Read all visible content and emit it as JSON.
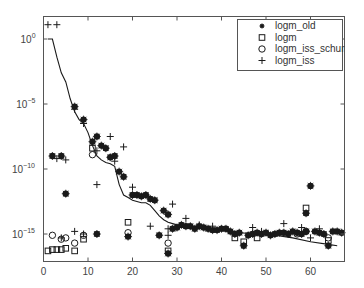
{
  "chart_data": {
    "type": "scatter",
    "title": "",
    "xlabel": "",
    "ylabel": "",
    "xscale": "linear",
    "yscale": "log",
    "xlim": [
      0,
      67
    ],
    "ylim_log10": [
      -17.5,
      1.7
    ],
    "grid": false,
    "legend_position": "upper right",
    "x_ticks": [
      0,
      10,
      20,
      30,
      40,
      50,
      60
    ],
    "x_tick_labels": [
      "0",
      "10",
      "20",
      "30",
      "40",
      "50",
      "60"
    ],
    "y_ticks_log10": [
      0,
      -5,
      -10,
      -15
    ],
    "y_tick_labels": [
      {
        "base": "10",
        "exp": "0"
      },
      {
        "base": "10",
        "exp": "−5"
      },
      {
        "base": "10",
        "exp": "−10"
      },
      {
        "base": "10",
        "exp": "−15"
      }
    ],
    "line": {
      "name": "condition-based bound (solid line)",
      "x": [
        1,
        2,
        3,
        4,
        5,
        6,
        7,
        8,
        9,
        10,
        11,
        12,
        13,
        14,
        15,
        16,
        17,
        18,
        19,
        20,
        21,
        22,
        23,
        24,
        25,
        26,
        27,
        28,
        29,
        30,
        32,
        35,
        38,
        40,
        44,
        48,
        52,
        56,
        60,
        64,
        66
      ],
      "log10": [
        0,
        0,
        -1.4,
        -2.6,
        -3.3,
        -4.6,
        -5.6,
        -6.2,
        -6.5,
        -7.2,
        -8.2,
        -9.0,
        -9.3,
        -9.5,
        -9.6,
        -9.8,
        -11.2,
        -12.0,
        -12.2,
        -12.4,
        -12.5,
        -12.6,
        -12.6,
        -12.8,
        -13.2,
        -13.6,
        -13.9,
        -14.1,
        -14.2,
        -14.3,
        -14.4,
        -14.5,
        -14.6,
        -14.7,
        -14.9,
        -15.0,
        -15.1,
        -15.3,
        -15.6,
        -15.8,
        -15.9
      ]
    },
    "series": [
      {
        "name": "logm_old",
        "marker": "asterisk-filled",
        "points": [
          [
            2,
            -9.0
          ],
          [
            4,
            -9.0
          ],
          [
            5,
            -11.9
          ],
          [
            7,
            -5.2
          ],
          [
            9,
            -6.2
          ],
          [
            11,
            -7.9
          ],
          [
            12,
            -7.5
          ],
          [
            12,
            -15.0
          ],
          [
            13,
            -8.2
          ],
          [
            14,
            -8.4
          ],
          [
            15,
            -9.1
          ],
          [
            16,
            -9.0
          ],
          [
            17,
            -10.2
          ],
          [
            18,
            -10.6
          ],
          [
            19,
            -15.2
          ],
          [
            20,
            -12.0
          ],
          [
            21,
            -12.0
          ],
          [
            22,
            -12.1
          ],
          [
            23,
            -12.0
          ],
          [
            24,
            -12.3
          ],
          [
            25,
            -12.4
          ],
          [
            26,
            -15.1
          ],
          [
            27,
            -13.2
          ],
          [
            28,
            -13.5
          ],
          [
            28,
            -16.5
          ],
          [
            29,
            -14.6
          ],
          [
            30,
            -14.5
          ],
          [
            31,
            -14.3
          ],
          [
            32,
            -14.4
          ],
          [
            33,
            -14.4
          ],
          [
            34,
            -14.6
          ],
          [
            35,
            -14.4
          ],
          [
            36,
            -14.5
          ],
          [
            37,
            -14.6
          ],
          [
            38,
            -14.7
          ],
          [
            39,
            -14.7
          ],
          [
            40,
            -14.6
          ],
          [
            41,
            -14.6
          ],
          [
            42,
            -14.8
          ],
          [
            43,
            -15.0
          ],
          [
            44,
            -14.9
          ],
          [
            45,
            -15.9
          ],
          [
            46,
            -15.1
          ],
          [
            47,
            -15.0
          ],
          [
            48,
            -14.9
          ],
          [
            49,
            -15.0
          ],
          [
            50,
            -14.9
          ],
          [
            51,
            -15.1
          ],
          [
            52,
            -15.0
          ],
          [
            53,
            -14.9
          ],
          [
            54,
            -14.9
          ],
          [
            55,
            -15.0
          ],
          [
            56,
            -14.8
          ],
          [
            57,
            -14.9
          ],
          [
            58,
            -15.0
          ],
          [
            59,
            -14.8
          ],
          [
            59,
            -13.4
          ],
          [
            60,
            -11.3
          ],
          [
            61,
            -14.8
          ],
          [
            62,
            -14.9
          ],
          [
            63,
            -15.0
          ],
          [
            64,
            -15.9
          ],
          [
            65,
            -14.8
          ],
          [
            66,
            -14.8
          ],
          [
            67,
            -14.9
          ]
        ]
      },
      {
        "name": "logm",
        "marker": "square-open",
        "points": [
          [
            1,
            -16.3
          ],
          [
            2,
            -16.2
          ],
          [
            3,
            -16.2
          ],
          [
            4,
            -16.2
          ],
          [
            5,
            -16.1
          ],
          [
            7,
            -16.3
          ],
          [
            9,
            -15.4
          ],
          [
            11,
            -8.4
          ],
          [
            19,
            -14.1
          ],
          [
            28,
            -16.3
          ],
          [
            43,
            -15.3
          ],
          [
            45,
            -15.6
          ],
          [
            48,
            -15.3
          ],
          [
            59,
            -13.0
          ],
          [
            64,
            -15.5
          ]
        ]
      },
      {
        "name": "logm_iss_schur",
        "marker": "circle-open",
        "points": [
          [
            2,
            -15.1
          ],
          [
            4,
            -15.4
          ],
          [
            5,
            -15.3
          ],
          [
            7,
            -15.7
          ],
          [
            9,
            -15.1
          ],
          [
            11,
            -8.9
          ],
          [
            19,
            -14.9
          ],
          [
            28,
            -15.7
          ],
          [
            57,
            -15.0
          ],
          [
            59,
            -14.8
          ],
          [
            64,
            -15.3
          ]
        ]
      },
      {
        "name": "logm_iss",
        "marker": "plus",
        "points": [
          [
            1,
            1.1
          ],
          [
            3,
            1.1
          ],
          [
            3,
            -9.2
          ],
          [
            5,
            -9.3
          ],
          [
            7,
            -5.4
          ],
          [
            9,
            -6.5
          ],
          [
            12,
            -8.6
          ],
          [
            12,
            -11.2
          ],
          [
            15,
            -7.5
          ],
          [
            16,
            -9.4
          ],
          [
            18,
            -8.3
          ],
          [
            20,
            -11.4
          ],
          [
            24,
            -14.4
          ],
          [
            28,
            -14.6
          ],
          [
            28,
            -15.1
          ],
          [
            29,
            -12.7
          ],
          [
            32,
            -13.8
          ],
          [
            35,
            -14.3
          ],
          [
            38,
            -14.4
          ],
          [
            47,
            -14.5
          ],
          [
            49,
            -14.8
          ],
          [
            54,
            -14.2
          ],
          [
            58,
            -14.5
          ],
          [
            60,
            -15.3
          ],
          [
            62,
            -14.6
          ],
          [
            4,
            -15.3
          ],
          [
            7,
            -14.8
          ],
          [
            9,
            -15.0
          ]
        ]
      }
    ],
    "legend": [
      {
        "label": "logm_old",
        "marker": "asterisk-filled"
      },
      {
        "label": "logm",
        "marker": "square-open"
      },
      {
        "label": "logm_iss_schur",
        "marker": "circle-open"
      },
      {
        "label": "logm_iss",
        "marker": "plus"
      }
    ]
  },
  "colors": {
    "axis": "#555555",
    "marker": "#1a1a1a",
    "line": "#1a1a1a",
    "text": "#444444",
    "background": "#ffffff"
  }
}
